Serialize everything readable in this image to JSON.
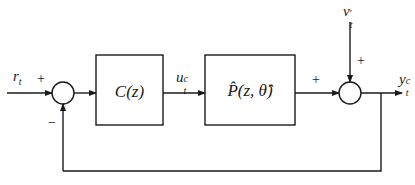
{
  "figure": {
    "clipped_caption_fragment": "Figure: closed-loop control block diagram (clipped)",
    "blocks": [
      {
        "id": "controller",
        "label_main": "C(z)"
      },
      {
        "id": "plant",
        "label_main": "P̂(z, θ̂)"
      }
    ],
    "signals": {
      "reference": {
        "base": "r",
        "sub": "t"
      },
      "control": {
        "base": "u",
        "sup": "c",
        "sub": "t"
      },
      "disturbance": {
        "base": "v",
        "sup": "′",
        "sub": "t"
      },
      "output": {
        "base": "y",
        "sup": "c",
        "sub": "t"
      }
    },
    "summing_junctions": [
      {
        "id": "sum1",
        "signs": {
          "reference": "+",
          "feedback": "−"
        }
      },
      {
        "id": "sum2",
        "signs": {
          "plant": "+",
          "disturbance": "+"
        }
      }
    ],
    "colors": {
      "stroke": "#1a1a1a",
      "background": "#ffffff"
    }
  }
}
